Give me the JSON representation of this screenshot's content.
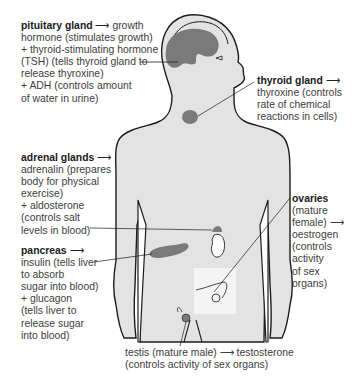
{
  "colors": {
    "skin": "#e3e3e3",
    "outline": "#1c1c1c",
    "gland": "#7a7a7a",
    "text": "#3d3d3d",
    "heading": "#1a1a1a"
  },
  "labels": {
    "pituitary": {
      "name": "pituitary gland",
      "arrow": "⟶",
      "lines": [
        "growth",
        "hormone (stimulates growth)",
        "+ thyroid-stimulating hormone",
        "(TSH) (tells thyroid gland to",
        "release thyroxine)",
        "+ ADH (controls amount",
        "of water in urine)"
      ]
    },
    "thyroid": {
      "name": "thyroid gland",
      "arrow": "⟶",
      "lines": [
        "thyroxine (controls",
        "rate of chemical",
        "reactions in cells)"
      ]
    },
    "adrenal": {
      "name": "adrenal glands",
      "arrow": "⟶",
      "lines": [
        "adrenalin (prepares",
        "body for physical",
        "exercise)",
        "+ aldosterone",
        "(controls salt",
        "levels in blood)"
      ]
    },
    "pancreas": {
      "name": "pancreas",
      "arrow": "⟶",
      "lines": [
        "insulin (tells liver",
        "to absorb",
        "sugar into blood)",
        "+ glucagon",
        "(tells liver to",
        "release sugar",
        "into blood)"
      ]
    },
    "ovaries": {
      "name": "ovaries",
      "lines": [
        "(mature",
        "female) ⟶",
        "oestrogen",
        "(controls",
        "activity",
        "of sex",
        "organs)"
      ]
    },
    "testis": {
      "lines": [
        "testis (mature male) ⟶ testosterone",
        "(controls activity of sex organs)"
      ]
    }
  }
}
